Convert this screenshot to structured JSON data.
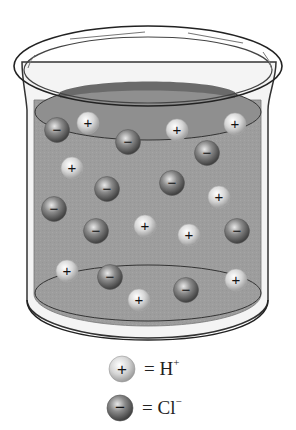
{
  "diagram": {
    "title": "",
    "container": "beaker",
    "solution_color": "#9a9a9a",
    "ions": [
      {
        "type": "Cl-",
        "x": 57,
        "y": 130
      },
      {
        "type": "H+",
        "x": 88,
        "y": 123
      },
      {
        "type": "Cl-",
        "x": 128,
        "y": 142
      },
      {
        "type": "H+",
        "x": 177,
        "y": 130
      },
      {
        "type": "H+",
        "x": 235,
        "y": 124
      },
      {
        "type": "Cl-",
        "x": 207,
        "y": 153
      },
      {
        "type": "H+",
        "x": 72,
        "y": 168
      },
      {
        "type": "Cl-",
        "x": 107,
        "y": 189
      },
      {
        "type": "Cl-",
        "x": 172,
        "y": 183
      },
      {
        "type": "H+",
        "x": 219,
        "y": 197
      },
      {
        "type": "Cl-",
        "x": 54,
        "y": 209
      },
      {
        "type": "Cl-",
        "x": 96,
        "y": 231
      },
      {
        "type": "H+",
        "x": 145,
        "y": 226
      },
      {
        "type": "H+",
        "x": 189,
        "y": 235
      },
      {
        "type": "Cl-",
        "x": 237,
        "y": 231
      },
      {
        "type": "H+",
        "x": 67,
        "y": 271
      },
      {
        "type": "Cl-",
        "x": 110,
        "y": 277
      },
      {
        "type": "H+",
        "x": 139,
        "y": 300
      },
      {
        "type": "Cl-",
        "x": 186,
        "y": 290
      },
      {
        "type": "H+",
        "x": 236,
        "y": 280
      }
    ],
    "counts": {
      "H+": 10,
      "Cl-": 10
    }
  },
  "legend": {
    "items": [
      {
        "symbol": "+",
        "label_base": "= H",
        "label_sup": "+",
        "ion": "H+"
      },
      {
        "symbol": "−",
        "label_base": "= Cl",
        "label_sup": "−",
        "ion": "Cl-"
      }
    ]
  }
}
